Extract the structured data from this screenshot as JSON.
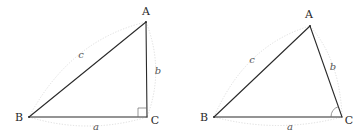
{
  "figures": [
    {
      "name": "right-triangle",
      "vertices": {
        "A": {
          "label": "A",
          "x": 146,
          "y": 22,
          "lx": 146,
          "ly": 15
        },
        "B": {
          "label": "B",
          "x": 29,
          "y": 117,
          "lx": 19,
          "ly": 121
        },
        "C": {
          "label": "C",
          "x": 147,
          "y": 117,
          "lx": 155,
          "ly": 124
        }
      },
      "sides": {
        "a": {
          "label": "a",
          "x": 96,
          "y": 130
        },
        "b": {
          "label": "b",
          "x": 158,
          "y": 74
        },
        "c": {
          "label": "c",
          "x": 81,
          "y": 58
        }
      },
      "angle_marker": "right-angle-square"
    },
    {
      "name": "oblique-triangle",
      "vertices": {
        "A": {
          "label": "A",
          "x": 310,
          "y": 26,
          "lx": 309,
          "ly": 18
        },
        "B": {
          "label": "B",
          "x": 214,
          "y": 117,
          "lx": 204,
          "ly": 121
        },
        "C": {
          "label": "C",
          "x": 342,
          "y": 117,
          "lx": 349,
          "ly": 124
        }
      },
      "sides": {
        "a": {
          "label": "a",
          "x": 290,
          "y": 130
        },
        "b": {
          "label": "b",
          "x": 333,
          "y": 70
        },
        "c": {
          "label": "c",
          "x": 252,
          "y": 63
        }
      },
      "angle_marker": "angle-arc-at-C"
    }
  ]
}
